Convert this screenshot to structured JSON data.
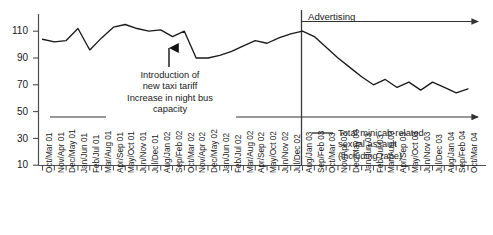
{
  "chart_data": {
    "type": "line",
    "title": "",
    "xlabel": "",
    "ylabel": "",
    "ylim": [
      10,
      118
    ],
    "yticks": [
      10,
      30,
      50,
      70,
      90,
      110
    ],
    "grid": false,
    "legend_position": "inside-bottom-right",
    "categories": [
      "Oct/Mar 01",
      "Nov/Apr 01",
      "Dec/May 01",
      "Jan/Jun 01",
      "Feb/Jul 01",
      "Mar/Aug 01",
      "Apr/Sep 01",
      "May/Oct 01",
      "Jun/Nov 01",
      "Jul/Dec 01",
      "Aug/Jan 02",
      "Sep/Feb 02",
      "Oct/Mar 02",
      "Nov/Apr 02",
      "Dec/May 02",
      "Jan/Jun 02",
      "Feb/Jul 02",
      "Mar/Aug 02",
      "Apr/Sep 02",
      "May/Oct 02",
      "Jun/Nov 02",
      "Jul/Dec 02",
      "Aug/Jan 03",
      "Sep/Feb 03",
      "Oct/Mar 03",
      "Nov/Apr 03",
      "Dec/May 03",
      "Jan/Jun 03",
      "Feb/Jul 03",
      "Mar/Aug 03",
      "Apr/Sep 03",
      "May/Oct 03",
      "Jun/Nov 03",
      "Jul/Dec 03",
      "Aug/Jan 04",
      "Sep/Feb 04",
      "Oct/Mar 04"
    ],
    "series": [
      {
        "name": "Total minicab-related sexual assault (including rape)",
        "values": [
          104,
          102,
          103,
          112,
          96,
          105,
          113,
          115,
          112,
          110,
          111,
          106,
          110,
          90,
          90,
          92,
          95,
          99,
          103,
          101,
          105,
          108,
          110,
          106,
          98,
          90,
          83,
          76,
          70,
          74,
          68,
          72,
          66,
          72,
          68,
          64,
          67
        ]
      }
    ],
    "annotations": [
      {
        "name": "taxi-tariff-annotation",
        "lines": [
          "Introduction of",
          "new taxi tariff",
          "Increase in night bus",
          "capacity"
        ],
        "points_to_category": "Nov/Apr 02"
      },
      {
        "name": "advertising-annotation",
        "label": "Advertising",
        "starts_at_category": "Aug/Jan 03"
      }
    ],
    "legend": [
      {
        "label_lines": [
          "Total minicab-related",
          "sexual assault",
          "(including rape)"
        ],
        "color": "#1a1a1a"
      }
    ]
  },
  "axis": {
    "ytick_labels": [
      "110",
      "90",
      "70",
      "50",
      "30",
      "10"
    ],
    "line_color": "#4d4d4d",
    "series_color": "#1a1a1a"
  },
  "labels": {
    "advertising": "Advertising",
    "annotation_line_1": "Introduction of",
    "annotation_line_2": "new taxi tariff",
    "annotation_line_3": "Increase in night bus",
    "annotation_line_4": "capacity",
    "legend_line_1": "Total minicab-related",
    "legend_line_2": "sexual assault",
    "legend_line_3": "(including rape)"
  }
}
